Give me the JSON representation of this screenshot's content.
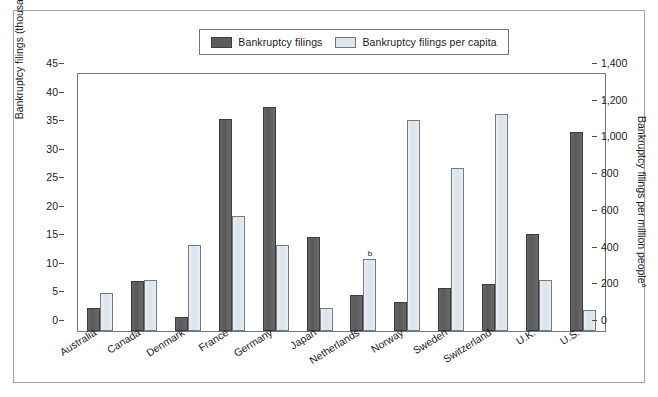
{
  "legend": {
    "items": [
      {
        "label": "Bankruptcy filings",
        "swatch": "dark-swatch",
        "color": "#5d5d5d"
      },
      {
        "label": "Bankruptcy filings per capita",
        "swatch": "light-swatch",
        "color": "#dfe6ec"
      }
    ]
  },
  "axes": {
    "left_title": "Bankruptcy filings (thousands)",
    "right_title": "Bankruptcy filings per million people",
    "right_title_superscript": "a",
    "left_ticks": [
      "0",
      "5",
      "10",
      "15",
      "20",
      "25",
      "30",
      "35",
      "40",
      "45"
    ],
    "right_ticks": [
      "0",
      "200",
      "400",
      "600",
      "800",
      "1,000",
      "1,200",
      "1,400"
    ]
  },
  "annotations": {
    "netherlands_marker": "b"
  },
  "chart_data": {
    "type": "bar",
    "title": "",
    "xlabel": "",
    "ylabel": "Bankruptcy filings (thousands)",
    "y2label": "Bankruptcy filings per million people",
    "ylim": [
      0,
      45
    ],
    "y2lim": [
      0,
      1400
    ],
    "grid": false,
    "legend_position": "top-center",
    "categories": [
      "Australia",
      "Canada",
      "Denmark",
      "France",
      "Germany",
      "Japan",
      "Netherlands",
      "Norway",
      "Sweden",
      "Switzerland",
      "U.K.",
      "U.S."
    ],
    "series": [
      {
        "name": "Bankruptcy filings",
        "axis": "left",
        "units": "thousands",
        "color": "#5d5d5d",
        "values": [
          4.0,
          8.8,
          2.4,
          37.2,
          39.3,
          16.5,
          6.3,
          5.1,
          7.6,
          8.3,
          17.0,
          34.9
        ]
      },
      {
        "name": "Bankruptcy filings per capita",
        "axis": "right",
        "units": "per million people",
        "color": "#dfe6ec",
        "values": [
          208,
          280,
          466,
          628,
          466,
          124,
          390,
          1148,
          887,
          1182,
          280,
          112
        ]
      }
    ]
  }
}
